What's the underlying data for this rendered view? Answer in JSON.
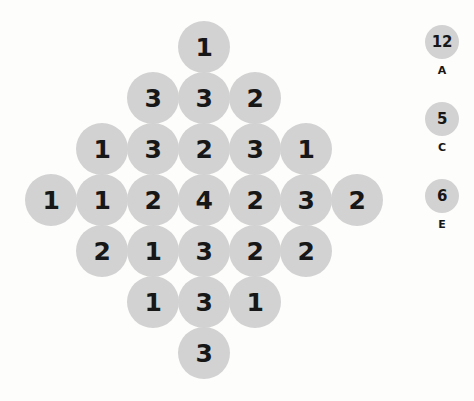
{
  "board": {
    "shape": "diamond",
    "circle_fill": "#d2d2d2",
    "text_color": "#171717",
    "background": "#fdfdfc",
    "circle_diameter": 52,
    "col_spacing": 51,
    "row_spacing": 51,
    "center_x": 204,
    "first_row_center_y": 47,
    "rows": [
      {
        "row_index": 0,
        "count": 1,
        "values": [
          "1"
        ]
      },
      {
        "row_index": 1,
        "count": 3,
        "values": [
          "3",
          "3",
          "2"
        ]
      },
      {
        "row_index": 2,
        "count": 5,
        "values": [
          "1",
          "3",
          "2",
          "3",
          "1"
        ]
      },
      {
        "row_index": 3,
        "count": 7,
        "values": [
          "1",
          "1",
          "2",
          "4",
          "2",
          "3",
          "2"
        ]
      },
      {
        "row_index": 4,
        "count": 5,
        "values": [
          "2",
          "1",
          "3",
          "2",
          "2"
        ]
      },
      {
        "row_index": 5,
        "count": 3,
        "values": [
          "1",
          "3",
          "1"
        ]
      },
      {
        "row_index": 6,
        "count": 1,
        "values": [
          "3"
        ]
      }
    ]
  },
  "legend": {
    "circle_diameter": 34,
    "items": [
      {
        "value": "12",
        "label": "A",
        "center_y": 42
      },
      {
        "value": "5",
        "label": "C",
        "center_y": 119
      },
      {
        "value": "6",
        "label": "E",
        "center_y": 196
      }
    ]
  }
}
